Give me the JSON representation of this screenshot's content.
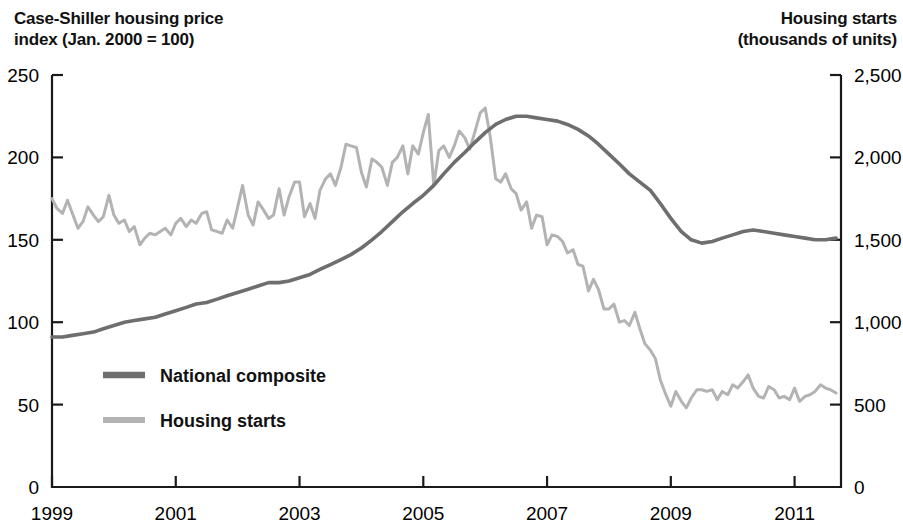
{
  "titles": {
    "left_axis": "Case-Shiller housing price\nindex (Jan. 2000 = 100)",
    "right_axis": "Housing starts\n(thousands of units)"
  },
  "colors": {
    "national_composite": "#6e6e6e",
    "housing_starts": "#b3b3b3",
    "axis": "#1a1a1a",
    "text": "#111111",
    "background": "#ffffff"
  },
  "legend": {
    "position": "inside-lower-left",
    "entries": [
      {
        "label": "National composite",
        "color": "#6e6e6e"
      },
      {
        "label": "Housing starts",
        "color": "#b3b3b3"
      }
    ]
  },
  "axes": {
    "x": {
      "ticks": [
        "1999",
        "2001",
        "2003",
        "2005",
        "2007",
        "2009",
        "2011"
      ],
      "tick_values": [
        1999,
        2001,
        2003,
        2005,
        2007,
        2009,
        2011
      ],
      "range": [
        1999.0,
        2011.75
      ]
    },
    "y_left": {
      "ticks": [
        "0",
        "50",
        "100",
        "150",
        "200",
        "250"
      ],
      "tick_values": [
        0,
        50,
        100,
        150,
        200,
        250
      ],
      "range": [
        0,
        250
      ]
    },
    "y_right": {
      "ticks": [
        "0",
        "500",
        "1,000",
        "1,500",
        "2,000",
        "2,500"
      ],
      "tick_values": [
        0,
        500,
        1000,
        1500,
        2000,
        2500
      ],
      "range": [
        0,
        2500
      ]
    },
    "grid": false
  },
  "chart_data": {
    "type": "line",
    "title": "",
    "subtitle": "",
    "xlabel": "",
    "ylabel": "Case-Shiller housing price index (Jan. 2000 = 100)",
    "ylabel_right": "Housing starts (thousands of units)",
    "xlim": [
      1999.0,
      2011.75
    ],
    "ylim": [
      0,
      250
    ],
    "ylim_right": [
      0,
      2500
    ],
    "grid": false,
    "legend_position": "inside-lower-left",
    "x_tick_labels": [
      "1999",
      "2001",
      "2003",
      "2005",
      "2007",
      "2009",
      "2011"
    ],
    "y_left_tick_labels": [
      "0",
      "50",
      "100",
      "150",
      "200",
      "250"
    ],
    "y_right_tick_labels": [
      "0",
      "500",
      "1,000",
      "1,500",
      "2,000",
      "2,500"
    ],
    "series": [
      {
        "name": "National composite",
        "axis": "left",
        "color": "#6e6e6e",
        "unit": "index (Jan. 2000 = 100)",
        "x": [
          1999.0,
          1999.17,
          1999.33,
          1999.5,
          1999.67,
          1999.83,
          2000.0,
          2000.17,
          2000.33,
          2000.5,
          2000.67,
          2000.83,
          2001.0,
          2001.17,
          2001.33,
          2001.5,
          2001.67,
          2001.83,
          2002.0,
          2002.17,
          2002.33,
          2002.5,
          2002.67,
          2002.83,
          2003.0,
          2003.17,
          2003.33,
          2003.5,
          2003.67,
          2003.83,
          2004.0,
          2004.17,
          2004.33,
          2004.5,
          2004.67,
          2004.83,
          2005.0,
          2005.17,
          2005.33,
          2005.5,
          2005.67,
          2005.83,
          2006.0,
          2006.17,
          2006.33,
          2006.5,
          2006.67,
          2006.83,
          2007.0,
          2007.17,
          2007.33,
          2007.5,
          2007.67,
          2007.83,
          2008.0,
          2008.17,
          2008.33,
          2008.5,
          2008.67,
          2008.83,
          2009.0,
          2009.17,
          2009.33,
          2009.5,
          2009.67,
          2009.83,
          2010.0,
          2010.17,
          2010.33,
          2010.5,
          2010.67,
          2010.83,
          2011.0,
          2011.17,
          2011.33,
          2011.5,
          2011.67
        ],
        "values": [
          91,
          91,
          92,
          93,
          94,
          96,
          98,
          100,
          101,
          102,
          103,
          105,
          107,
          109,
          111,
          112,
          114,
          116,
          118,
          120,
          122,
          124,
          124,
          125,
          127,
          129,
          132,
          135,
          138,
          141,
          145,
          150,
          155,
          161,
          167,
          172,
          177,
          183,
          190,
          197,
          203,
          209,
          215,
          220,
          223,
          225,
          225,
          224,
          223,
          222,
          220,
          217,
          213,
          208,
          202,
          196,
          190,
          185,
          180,
          172,
          163,
          155,
          150,
          148,
          149,
          151,
          153,
          155,
          156,
          155,
          154,
          153,
          152,
          151,
          150,
          150,
          151
        ]
      },
      {
        "name": "Housing starts",
        "axis": "right",
        "color": "#b3b3b3",
        "unit": "thousands of units",
        "x": [
          1999.0,
          1999.08,
          1999.17,
          1999.25,
          1999.33,
          1999.42,
          1999.5,
          1999.58,
          1999.67,
          1999.75,
          1999.83,
          1999.92,
          2000.0,
          2000.08,
          2000.17,
          2000.25,
          2000.33,
          2000.42,
          2000.5,
          2000.58,
          2000.67,
          2000.75,
          2000.83,
          2000.92,
          2001.0,
          2001.08,
          2001.17,
          2001.25,
          2001.33,
          2001.42,
          2001.5,
          2001.58,
          2001.67,
          2001.75,
          2001.83,
          2001.92,
          2002.0,
          2002.08,
          2002.17,
          2002.25,
          2002.33,
          2002.42,
          2002.5,
          2002.58,
          2002.67,
          2002.75,
          2002.83,
          2002.92,
          2003.0,
          2003.08,
          2003.17,
          2003.25,
          2003.33,
          2003.42,
          2003.5,
          2003.58,
          2003.67,
          2003.75,
          2003.83,
          2003.92,
          2004.0,
          2004.08,
          2004.17,
          2004.25,
          2004.33,
          2004.42,
          2004.5,
          2004.58,
          2004.67,
          2004.75,
          2004.83,
          2004.92,
          2005.0,
          2005.08,
          2005.17,
          2005.25,
          2005.33,
          2005.42,
          2005.5,
          2005.58,
          2005.67,
          2005.75,
          2005.83,
          2005.92,
          2006.0,
          2006.08,
          2006.17,
          2006.25,
          2006.33,
          2006.42,
          2006.5,
          2006.58,
          2006.67,
          2006.75,
          2006.83,
          2006.92,
          2007.0,
          2007.08,
          2007.17,
          2007.25,
          2007.33,
          2007.42,
          2007.5,
          2007.58,
          2007.67,
          2007.75,
          2007.83,
          2007.92,
          2008.0,
          2008.08,
          2008.17,
          2008.25,
          2008.33,
          2008.42,
          2008.5,
          2008.58,
          2008.67,
          2008.75,
          2008.83,
          2008.92,
          2009.0,
          2009.08,
          2009.17,
          2009.25,
          2009.33,
          2009.42,
          2009.5,
          2009.58,
          2009.67,
          2009.75,
          2009.83,
          2009.92,
          2010.0,
          2010.08,
          2010.17,
          2010.25,
          2010.33,
          2010.42,
          2010.5,
          2010.58,
          2010.67,
          2010.75,
          2010.83,
          2010.92,
          2011.0,
          2011.08,
          2011.17,
          2011.25,
          2011.33,
          2011.42,
          2011.5,
          2011.58,
          2011.67
        ],
        "values": [
          1750,
          1690,
          1660,
          1740,
          1660,
          1570,
          1610,
          1700,
          1650,
          1610,
          1640,
          1770,
          1650,
          1600,
          1620,
          1550,
          1580,
          1470,
          1510,
          1540,
          1530,
          1550,
          1570,
          1530,
          1600,
          1630,
          1580,
          1620,
          1600,
          1660,
          1670,
          1560,
          1550,
          1540,
          1620,
          1570,
          1700,
          1830,
          1650,
          1590,
          1730,
          1680,
          1630,
          1650,
          1810,
          1650,
          1760,
          1850,
          1850,
          1640,
          1720,
          1630,
          1800,
          1870,
          1900,
          1830,
          1940,
          2080,
          2070,
          2060,
          1910,
          1820,
          1990,
          1970,
          1940,
          1830,
          1970,
          2000,
          2070,
          1900,
          2070,
          2020,
          2150,
          2260,
          1830,
          2040,
          2070,
          2000,
          2070,
          2160,
          2120,
          2050,
          2150,
          2270,
          2300,
          2130,
          1870,
          1850,
          1900,
          1810,
          1780,
          1680,
          1730,
          1570,
          1650,
          1640,
          1470,
          1530,
          1520,
          1490,
          1420,
          1440,
          1350,
          1340,
          1190,
          1260,
          1200,
          1080,
          1080,
          1110,
          1000,
          1010,
          980,
          1060,
          960,
          870,
          830,
          780,
          650,
          560,
          490,
          580,
          520,
          480,
          540,
          590,
          590,
          580,
          590,
          530,
          580,
          560,
          620,
          600,
          640,
          680,
          600,
          550,
          540,
          610,
          590,
          540,
          550,
          530,
          600,
          520,
          550,
          560,
          580,
          620,
          600,
          590,
          570
        ]
      }
    ]
  }
}
